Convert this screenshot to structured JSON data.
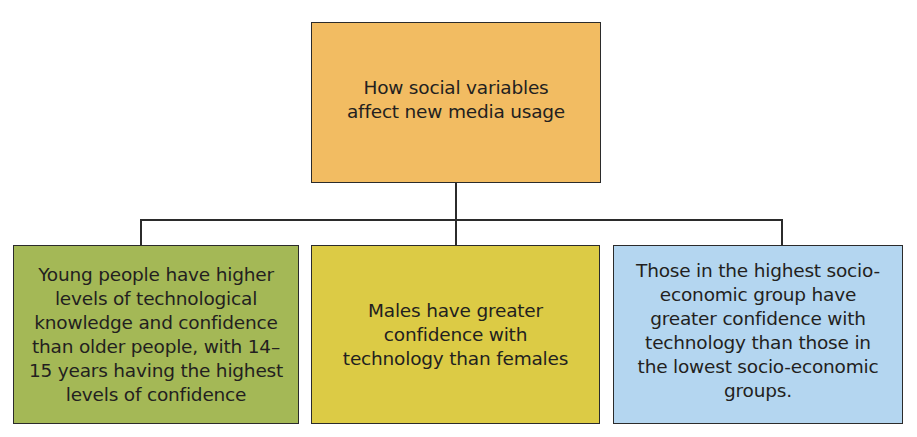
{
  "diagram": {
    "type": "hierarchy",
    "root": {
      "text": "How social variables affect new media usage",
      "color": "#f2bc62"
    },
    "children": [
      {
        "text": "Young people have higher levels of technological knowledge and confidence than older people, with 14–15 years having the highest levels of confidence",
        "color": "#a4b856"
      },
      {
        "text": "Males have greater confidence with technology than females",
        "color": "#dccb45"
      },
      {
        "text": "Those in the highest socio-economic group have greater confidence with technology than those in the lowest socio-economic groups.",
        "color": "#b4d6f0"
      }
    ],
    "connector_color": "#2b2b2b"
  }
}
